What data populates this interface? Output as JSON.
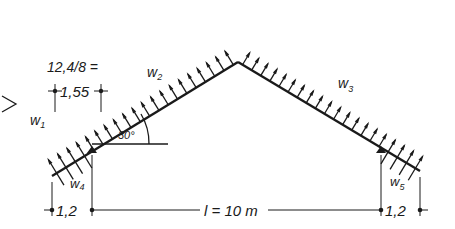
{
  "diagram": {
    "type": "roof wind load sketch",
    "pitch_angle_label": "30°",
    "load_labels": {
      "w1": {
        "main": "w",
        "sub": "1"
      },
      "w2": {
        "main": "w",
        "sub": "2"
      },
      "w3": {
        "main": "w",
        "sub": "3"
      },
      "w4": {
        "main": "w",
        "sub": "4"
      },
      "w5": {
        "main": "w",
        "sub": "5"
      }
    },
    "dimensions": {
      "top_formula": "12,4/8 =",
      "top_value": "1,55",
      "left_overhang": "1,2",
      "span": "l = 10 m",
      "right_overhang": "1,2"
    },
    "colors": {
      "ink": "#1a1a1a",
      "background": "#ffffff"
    }
  }
}
